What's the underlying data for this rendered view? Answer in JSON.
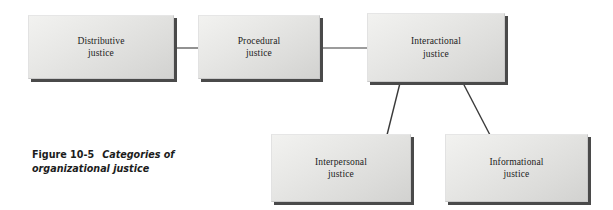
{
  "figure": {
    "caption_label": "Figure 10-5",
    "caption_title_line1": "Categories of",
    "caption_title_line2": "organizational justice",
    "caption_full": "Figure 10-5  Categories of organizational justice"
  },
  "colors": {
    "background": "#ffffff",
    "box_fill_light": "#f2f2f0",
    "box_fill_dark": "#d2d2d0",
    "box_border": "#c9c9c9",
    "box_shadow": "#4a4a4a",
    "connector": "#3a3a3a",
    "text": "#1b1b1b"
  },
  "nodes": [
    {
      "id": "distributive-justice",
      "line1": "Distributive",
      "line2": "justice",
      "x": 28,
      "y": 15,
      "w": 146,
      "h": 64
    },
    {
      "id": "procedural-justice",
      "line1": "Procedural",
      "line2": "justice",
      "x": 198,
      "y": 15,
      "w": 122,
      "h": 64
    },
    {
      "id": "interactional-justice",
      "line1": "Interactional",
      "line2": "justice",
      "x": 367,
      "y": 13,
      "w": 138,
      "h": 69
    },
    {
      "id": "interpersonal-justice",
      "line1": "Interpersonal",
      "line2": "justice",
      "x": 271,
      "y": 134,
      "w": 140,
      "h": 68
    },
    {
      "id": "informational-justice",
      "line1": "Informational",
      "line2": "justice",
      "x": 445,
      "y": 134,
      "w": 143,
      "h": 68
    }
  ],
  "connectors": [
    {
      "id": "distributive-to-procedural",
      "from": "distributive-justice",
      "to": "procedural-justice",
      "kind": "horizontal",
      "x1": 175,
      "y1": 48,
      "x2": 198,
      "y2": 48
    },
    {
      "id": "procedural-to-interactional",
      "from": "procedural-justice",
      "to": "interactional-justice",
      "kind": "horizontal",
      "x1": 321,
      "y1": 48,
      "x2": 367,
      "y2": 48
    },
    {
      "id": "interactional-to-interpersonal",
      "from": "interactional-justice",
      "to": "interpersonal-justice",
      "kind": "diagonal",
      "x1": 400,
      "y1": 83,
      "x2": 387,
      "y2": 134
    },
    {
      "id": "interactional-to-informational",
      "from": "interactional-justice",
      "to": "informational-justice",
      "kind": "diagonal",
      "x1": 463,
      "y1": 83,
      "x2": 490,
      "y2": 134
    }
  ]
}
